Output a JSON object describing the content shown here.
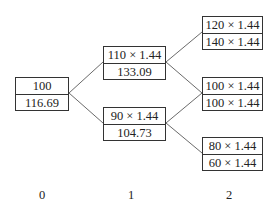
{
  "diagram": {
    "type": "binomial-tree",
    "nodes": {
      "n0": {
        "top": "100",
        "bottom": "116.69"
      },
      "n1u": {
        "top": "110 × 1.44",
        "bottom": "133.09"
      },
      "n1d": {
        "top": "90 × 1.44",
        "bottom": "104.73"
      },
      "n2u": {
        "top": "120 × 1.44",
        "bottom": "140 × 1.44"
      },
      "n2m": {
        "top": "100 × 1.44",
        "bottom": "100 × 1.44"
      },
      "n2d": {
        "top": "80 × 1.44",
        "bottom": "60 × 1.44"
      }
    },
    "edges": [
      [
        "n0",
        "n1u"
      ],
      [
        "n0",
        "n1d"
      ],
      [
        "n1u",
        "n2u"
      ],
      [
        "n1u",
        "n2m"
      ],
      [
        "n1d",
        "n2m"
      ],
      [
        "n1d",
        "n2d"
      ]
    ],
    "time_labels": [
      "0",
      "1",
      "2"
    ]
  }
}
